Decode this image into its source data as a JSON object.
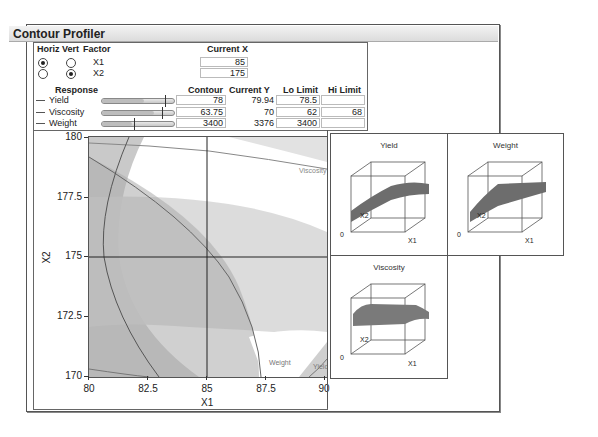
{
  "window": {
    "title": "Contour Profiler"
  },
  "factors": {
    "headers": {
      "horiz": "Horiz",
      "vert": "Vert",
      "factor": "Factor",
      "current_x": "Current X"
    },
    "rows": [
      {
        "name": "X1",
        "horiz": true,
        "vert": false,
        "current_x": "85"
      },
      {
        "name": "X2",
        "horiz": false,
        "vert": true,
        "current_x": "175"
      }
    ]
  },
  "responses": {
    "headers": {
      "response": "Response",
      "contour": "Contour",
      "current_y": "Current Y",
      "lo_limit": "Lo Limit",
      "hi_limit": "Hi Limit"
    },
    "rows": [
      {
        "name": "Yield",
        "contour": "78",
        "current_y": "79.94",
        "lo_limit": "78.5",
        "hi_limit": "",
        "slider_pct": 87
      },
      {
        "name": "Viscosity",
        "contour": "63.75",
        "current_y": "70",
        "lo_limit": "62",
        "hi_limit": "68",
        "slider_pct": 82
      },
      {
        "name": "Weight",
        "contour": "3400",
        "current_y": "3376",
        "lo_limit": "3400",
        "hi_limit": "",
        "slider_pct": 45
      }
    ]
  },
  "contour_plot": {
    "xlabel": "X1",
    "ylabel": "X2",
    "x_ticks": [
      "80",
      "82.5",
      "85",
      "87.5",
      "90"
    ],
    "y_ticks": [
      "180",
      "177.5",
      "175",
      "172.5",
      "170"
    ],
    "crosshair": {
      "x": "85",
      "y": "175"
    },
    "curve_labels": {
      "viscosity": "Viscosity",
      "weight": "Weight",
      "yield": "Yield"
    }
  },
  "surface_plots": [
    {
      "title": "Yield",
      "axis_x": "X1",
      "axis_y": "X2",
      "origin": "0"
    },
    {
      "title": "Weight",
      "axis_x": "X1",
      "axis_y": "X2",
      "origin": "0"
    },
    {
      "title": "Viscosity",
      "axis_x": "X1",
      "axis_y": "X2",
      "origin": "0"
    }
  ]
}
